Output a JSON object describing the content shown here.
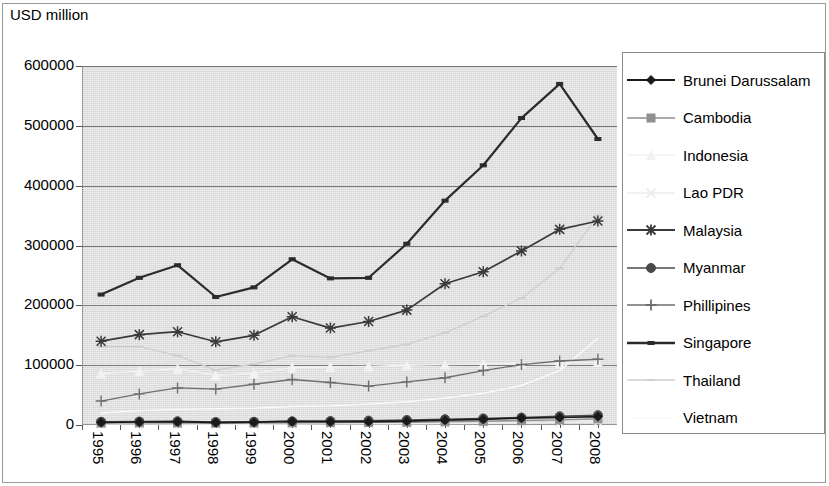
{
  "chart_data": {
    "type": "line",
    "title": "USD million",
    "ylabel": "USD million",
    "xlabel": "",
    "ylim": [
      0,
      600000
    ],
    "ytick_step": 100000,
    "yticks": [
      "0",
      "100000",
      "200000",
      "300000",
      "400000",
      "500000",
      "600000"
    ],
    "grid": true,
    "legend_position": "right",
    "categories": [
      "1995",
      "1996",
      "1997",
      "1998",
      "1999",
      "2000",
      "2001",
      "2002",
      "2003",
      "2004",
      "2005",
      "2006",
      "2007",
      "2008"
    ],
    "series": [
      {
        "name": "Brunei Darussalam",
        "marker": "diamond",
        "color": "#1a1a1a",
        "values": [
          4500,
          5000,
          5500,
          4000,
          4800,
          6000,
          5500,
          5600,
          6500,
          8000,
          9500,
          11500,
          12500,
          14000
        ]
      },
      {
        "name": "Cambodia",
        "marker": "square",
        "color": "#8f8f8f",
        "values": [
          3200,
          3500,
          3400,
          3100,
          3400,
          3700,
          4000,
          4300,
          4700,
          5400,
          6300,
          7300,
          8600,
          10300
        ]
      },
      {
        "name": "Indonesia",
        "marker": "triangle",
        "color": "#f2f2f2",
        "values": [
          86000,
          90000,
          94000,
          83000,
          86000,
          96000,
          97000,
          98000,
          100000,
          101000,
          102000,
          103000,
          104000,
          105000
        ]
      },
      {
        "name": "Lao PDR",
        "marker": "x",
        "color": "#ededed",
        "values": [
          1700,
          1800,
          1700,
          1300,
          1400,
          1700,
          1800,
          1900,
          2100,
          2400,
          2800,
          3400,
          4200,
          5300
        ]
      },
      {
        "name": "Malaysia",
        "marker": "asterisk",
        "color": "#3a3a3a",
        "values": [
          140000,
          151000,
          156000,
          139000,
          150000,
          181000,
          162000,
          173000,
          192000,
          236000,
          256000,
          291000,
          327000,
          341000
        ]
      },
      {
        "name": "Myanmar",
        "marker": "circle",
        "color": "#4a4a4a",
        "values": [
          5400,
          5900,
          6300,
          5000,
          5400,
          6200,
          6700,
          7400,
          8400,
          9800,
          11000,
          12500,
          14500,
          16500
        ]
      },
      {
        "name": "Phillipines",
        "marker": "plus",
        "color": "#6e6e6e",
        "values": [
          40000,
          52000,
          62000,
          60000,
          68000,
          76000,
          71000,
          65000,
          72000,
          79000,
          91000,
          101000,
          107000,
          110000
        ]
      },
      {
        "name": "Singapore",
        "marker": "bar",
        "color": "#2b2b2b",
        "values": [
          218000,
          246000,
          267000,
          214000,
          230000,
          277000,
          245000,
          246000,
          303000,
          375000,
          434000,
          513000,
          570000,
          478000
        ]
      },
      {
        "name": "Thailand",
        "marker": "dash",
        "color": "#cfcfcf",
        "values": [
          131000,
          131000,
          116000,
          92000,
          102000,
          116000,
          113000,
          124000,
          135000,
          154000,
          182000,
          212000,
          262000,
          350000
        ]
      },
      {
        "name": "Vietnam",
        "marker": "none",
        "color": "#fafafa",
        "values": [
          20000,
          24000,
          26000,
          27000,
          28000,
          31000,
          32000,
          35000,
          39000,
          45000,
          53000,
          66000,
          91000,
          145000
        ]
      }
    ]
  },
  "legend": {
    "items": [
      {
        "label": "Brunei Darussalam",
        "marker": "diamond-marker"
      },
      {
        "label": "Cambodia",
        "marker": "square-marker"
      },
      {
        "label": "Indonesia",
        "marker": "triangle-marker"
      },
      {
        "label": "Lao PDR",
        "marker": "x-marker"
      },
      {
        "label": "Malaysia",
        "marker": "asterisk-marker"
      },
      {
        "label": "Myanmar",
        "marker": "circle-marker"
      },
      {
        "label": "Phillipines",
        "marker": "plus-marker"
      },
      {
        "label": "Singapore",
        "marker": "bar-marker"
      },
      {
        "label": "Thailand",
        "marker": "dash-marker"
      },
      {
        "label": "Vietnam",
        "marker": "none-marker"
      }
    ]
  }
}
